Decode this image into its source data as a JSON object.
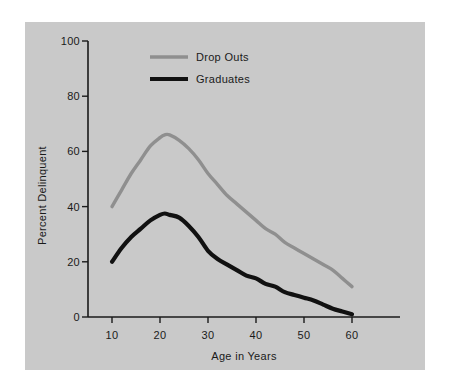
{
  "chart_data": {
    "type": "line",
    "title": "",
    "xlabel": "Age in Years",
    "ylabel": "Percent Delinquent",
    "xlim": [
      5,
      70
    ],
    "ylim": [
      0,
      100
    ],
    "xticks": [
      10,
      20,
      30,
      40,
      50,
      60
    ],
    "yticks": [
      0,
      20,
      40,
      60,
      80,
      100
    ],
    "grid": false,
    "legend_position": "top-center",
    "series": [
      {
        "name": "Drop Outs",
        "color": "#8f8f8f",
        "x": [
          10,
          12,
          14,
          16,
          18,
          20,
          21,
          22,
          24,
          26,
          28,
          30,
          32,
          34,
          36,
          38,
          40,
          42,
          44,
          46,
          48,
          50,
          52,
          54,
          56,
          58,
          60
        ],
        "values": [
          40,
          46,
          52,
          57,
          62,
          65,
          66,
          66,
          64,
          61,
          57,
          52,
          48,
          44,
          41,
          38,
          35,
          32,
          30,
          27,
          25,
          23,
          21,
          19,
          17,
          14,
          11
        ]
      },
      {
        "name": "Graduates",
        "color": "#111111",
        "x": [
          10,
          12,
          14,
          16,
          18,
          20,
          21,
          22,
          24,
          26,
          28,
          30,
          32,
          34,
          36,
          38,
          40,
          42,
          44,
          46,
          48,
          50,
          52,
          54,
          56,
          58,
          60
        ],
        "values": [
          20,
          25,
          29,
          32,
          35,
          37,
          37.5,
          37,
          36,
          33,
          29,
          24,
          21,
          19,
          17,
          15,
          14,
          12,
          11,
          9,
          8,
          7,
          6,
          4.5,
          3,
          2,
          1
        ]
      }
    ]
  },
  "axes": {
    "y_tick_labels": [
      "0",
      "20",
      "40",
      "60",
      "80",
      "100"
    ],
    "x_tick_labels": [
      "10",
      "20",
      "30",
      "40",
      "50",
      "60"
    ],
    "y_axis_title": "Percent Delinquent",
    "x_axis_title": "Age in Years"
  },
  "legend": {
    "items": [
      {
        "label": "Drop Outs",
        "color": "#8f8f8f"
      },
      {
        "label": "Graduates",
        "color": "#111111"
      }
    ]
  },
  "colors": {
    "panel_background": "#c9c9c9",
    "figure_background": "#ffffff",
    "axis": "#1a1a1a",
    "drop_outs": "#8f8f8f",
    "graduates": "#111111"
  }
}
